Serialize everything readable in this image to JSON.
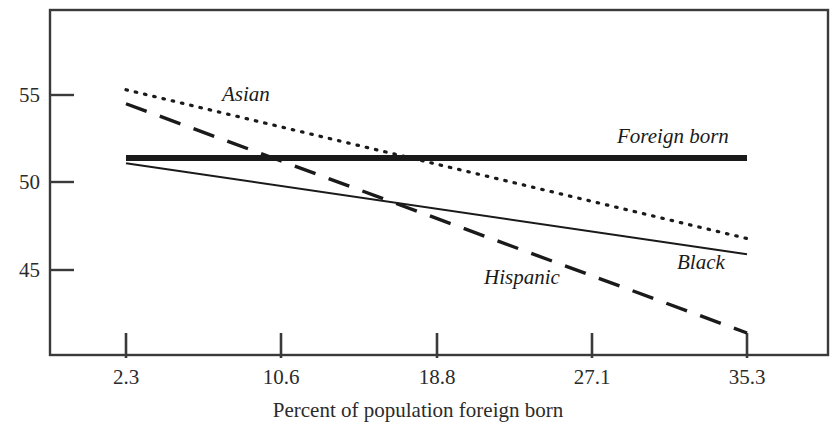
{
  "chart_data": {
    "type": "line",
    "title": "",
    "subtitle": "",
    "xlabel": "Percent of population foreign born",
    "ylabel": "",
    "x_tick_labels": [
      "2.3",
      "10.6",
      "18.8",
      "27.1",
      "35.3"
    ],
    "x_tick_values": [
      2.3,
      10.6,
      18.8,
      27.1,
      35.3
    ],
    "y_tick_labels": [
      "55",
      "50",
      "45"
    ],
    "y_tick_values": [
      55,
      50,
      45
    ],
    "xlim": [
      2.3,
      35.3
    ],
    "ylim": [
      41.0,
      57.2
    ],
    "grid": false,
    "legend_position": "inline-annotations",
    "series": [
      {
        "name": "Asian",
        "style": "dotted",
        "label": "Asian",
        "x": [
          2.3,
          35.3
        ],
        "values": [
          55.3,
          46.8
        ]
      },
      {
        "name": "Hispanic",
        "style": "dashed",
        "label": "Hispanic",
        "x": [
          2.3,
          35.3
        ],
        "values": [
          54.5,
          41.4
        ]
      },
      {
        "name": "Foreign born",
        "style": "solid-thick",
        "label": "Foreign born",
        "x": [
          2.3,
          35.3
        ],
        "values": [
          51.4,
          51.4
        ]
      },
      {
        "name": "Black",
        "style": "solid-thin",
        "label": "Black",
        "x": [
          2.3,
          35.3
        ],
        "values": [
          51.1,
          45.9
        ]
      }
    ],
    "annotations": [
      {
        "text": "Asian",
        "x_px": 222,
        "y_px": 85
      },
      {
        "text": "Foreign born",
        "x_px": 617,
        "y_px": 128
      },
      {
        "text": "Hispanic",
        "x_px": 484,
        "y_px": 267
      },
      {
        "text": "Black",
        "x_px": 677,
        "y_px": 252
      }
    ],
    "colors": {
      "line": "#1a1a1a",
      "frame": "#3a3a3a",
      "text": "#2b2b2b",
      "background": "#ffffff"
    }
  },
  "axes": {
    "x_title": "Percent of population foreign born",
    "ticks_x": [
      {
        "label": "2.3",
        "px": 126
      },
      {
        "label": "10.6",
        "px": 281
      },
      {
        "label": "18.8",
        "px": 437
      },
      {
        "label": "27.1",
        "px": 592
      },
      {
        "label": "35.3",
        "px": 747
      }
    ],
    "ticks_y": [
      {
        "label": "55",
        "px": 95
      },
      {
        "label": "50",
        "px": 182
      },
      {
        "label": "45",
        "px": 270
      }
    ]
  },
  "labels": {
    "asian": "Asian",
    "foreign_born": "Foreign born",
    "hispanic": "Hispanic",
    "black": "Black"
  }
}
